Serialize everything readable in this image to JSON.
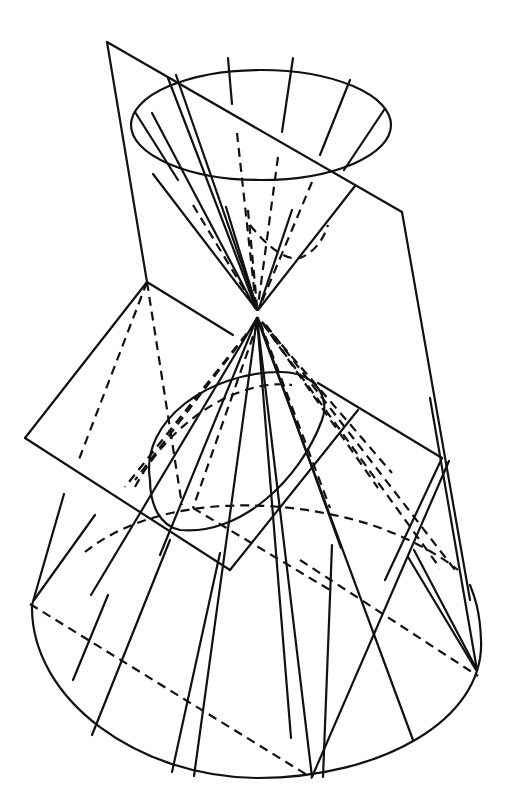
{
  "figure": {
    "title": "",
    "line_color": "#111111",
    "background": "#ffffff"
  },
  "geometry": {
    "upper_cone": {
      "rim_ellipse": {
        "cx": 261,
        "cy": 125,
        "rx": 130,
        "ry": 55
      },
      "apex": [
        257,
        312
      ],
      "visible_generators_top": [
        [
          150,
          113
        ],
        [
          235,
          58
        ],
        [
          292,
          58
        ],
        [
          350,
          80
        ],
        [
          385,
          110
        ]
      ],
      "hidden_generators_top": [
        [
          237,
          133
        ],
        [
          278,
          157
        ],
        [
          312,
          182
        ]
      ]
    },
    "lower_cone": {
      "apex": [
        257,
        318
      ],
      "base_ellipse": {
        "cx": 256,
        "cy": 640,
        "rx": 226,
        "ry": 140
      }
    },
    "tall_plane": [
      [
        107,
        42
      ],
      [
        402,
        212
      ],
      [
        470,
        600
      ],
      [
        147,
        282
      ]
    ],
    "tilted_plane": [
      [
        147,
        282
      ],
      [
        233,
        335
      ],
      [
        345,
        413
      ],
      [
        442,
        458
      ],
      [
        230,
        570
      ],
      [
        25,
        438
      ]
    ]
  }
}
